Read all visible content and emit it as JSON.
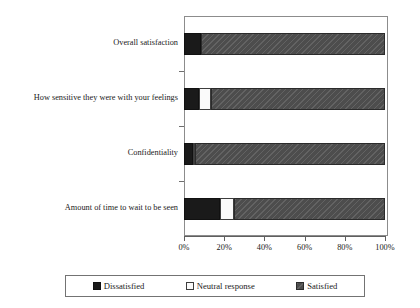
{
  "chart_data": {
    "type": "bar",
    "orientation": "horizontal",
    "stacked": true,
    "stack_mode": "percent",
    "title": "",
    "xlabel": "",
    "ylabel": "",
    "xlim": [
      0,
      100
    ],
    "grid": false,
    "legend_position": "bottom",
    "categories": [
      "Overall satisfaction",
      "How sensitive they were with your feelings",
      "Confidentiality",
      "Amount of time to wait to be seen"
    ],
    "xticklabels": [
      "0%",
      "20%",
      "40%",
      "60%",
      "80%",
      "100%"
    ],
    "xtickvalues": [
      0,
      20,
      40,
      60,
      80,
      100
    ],
    "series": [
      {
        "name": "Dissatisfied",
        "color": "#1a1a1a",
        "values": [
          8.5,
          7.5,
          4.5,
          18
        ]
      },
      {
        "name": "Neutral response",
        "color": "#fafafa",
        "values": [
          0,
          6,
          1,
          7
        ]
      },
      {
        "name": "Satisfied",
        "color": "#4d4d4d",
        "values": [
          91.5,
          86.5,
          94.5,
          75
        ]
      }
    ]
  },
  "legend": {
    "items": [
      {
        "label": "Dissatisfied",
        "swatch": "legend-swatch-dissatisfied"
      },
      {
        "label": "Neutral response",
        "swatch": "legend-swatch-neutral"
      },
      {
        "label": "Satisfied",
        "swatch": "legend-swatch-satisfied"
      }
    ]
  }
}
